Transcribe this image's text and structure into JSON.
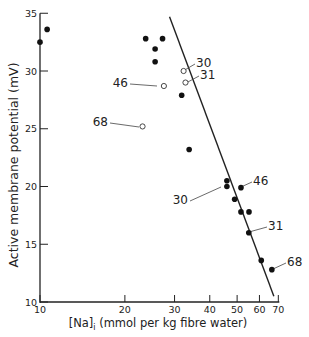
{
  "chart_data": {
    "type": "scatter",
    "title": "",
    "xlabel": "[Na]i (mmol per kg fibre water)",
    "xlabel_parts": {
      "bracket": "[Na]",
      "sub": "i",
      "rest": " (mmol per kg fibre water)"
    },
    "ylabel": "Active membrane potential (mV)",
    "xscale": "log",
    "xlim": [
      10,
      70
    ],
    "ylim": [
      10,
      35
    ],
    "x_ticks": [
      10,
      20,
      30,
      40,
      50,
      60,
      70
    ],
    "x_tick_labels": [
      "10",
      "20",
      "30",
      "40",
      "50",
      "60",
      "70"
    ],
    "y_ticks": [
      10,
      15,
      20,
      25,
      30,
      35
    ],
    "y_tick_labels": [
      "10",
      "15",
      "20",
      "25",
      "30",
      "35"
    ],
    "grid": false,
    "series": [
      {
        "name": "filled",
        "marker": "filled-circle",
        "points": [
          {
            "x": 10.0,
            "y": 32.5
          },
          {
            "x": 10.6,
            "y": 33.6
          },
          {
            "x": 23.7,
            "y": 32.8
          },
          {
            "x": 27.2,
            "y": 32.8
          },
          {
            "x": 25.6,
            "y": 31.9
          },
          {
            "x": 25.6,
            "y": 30.8
          },
          {
            "x": 31.8,
            "y": 27.9
          },
          {
            "x": 33.8,
            "y": 23.2
          },
          {
            "x": 46.0,
            "y": 20.5
          },
          {
            "x": 46.0,
            "y": 20.0
          },
          {
            "x": 51.6,
            "y": 19.9
          },
          {
            "x": 49.0,
            "y": 18.9
          },
          {
            "x": 51.6,
            "y": 17.8
          },
          {
            "x": 55.1,
            "y": 17.8
          },
          {
            "x": 55.0,
            "y": 16.0
          },
          {
            "x": 60.9,
            "y": 13.6
          },
          {
            "x": 66.4,
            "y": 12.8
          }
        ]
      },
      {
        "name": "open",
        "marker": "open-circle",
        "points": [
          {
            "x": 32.3,
            "y": 30.0
          },
          {
            "x": 32.8,
            "y": 29.0
          },
          {
            "x": 27.5,
            "y": 28.7
          },
          {
            "x": 23.1,
            "y": 25.2
          }
        ]
      }
    ],
    "fit_line": {
      "x1": 28.8,
      "y1": 34.7,
      "x2": 67.5,
      "y2": 10.5
    },
    "annotations": [
      {
        "text": "30",
        "target": {
          "x": 32.3,
          "y": 30.0
        },
        "label_px": [
          196,
          63
        ],
        "point_px": [
          180,
          72
        ]
      },
      {
        "text": "31",
        "target": {
          "x": 32.8,
          "y": 29.0
        },
        "label_px": [
          200,
          75
        ],
        "point_px": [
          183,
          84
        ]
      },
      {
        "text": "46",
        "target": {
          "x": 27.5,
          "y": 28.7
        },
        "label_px": [
          128,
          83
        ],
        "point_px": [
          160,
          87
        ]
      },
      {
        "text": "68",
        "target": {
          "x": 23.1,
          "y": 25.2
        },
        "label_px": [
          108,
          122
        ],
        "point_px": [
          142,
          128
        ]
      },
      {
        "text": "46",
        "target": {
          "x": 51.6,
          "y": 19.9
        },
        "label_px": [
          253,
          181
        ],
        "point_px": [
          238,
          188
        ]
      },
      {
        "text": "30",
        "target": {
          "x": 46.0,
          "y": 20.0
        },
        "label_px": [
          188,
          200
        ],
        "point_px": [
          224,
          188
        ]
      },
      {
        "text": "31",
        "target": {
          "x": 55.0,
          "y": 16.0
        },
        "label_px": [
          268,
          226
        ],
        "point_px": [
          246,
          233
        ]
      },
      {
        "text": "68",
        "target": {
          "x": 66.4,
          "y": 12.8
        },
        "label_px": [
          287,
          262
        ],
        "point_px": [
          270,
          270
        ]
      }
    ]
  }
}
